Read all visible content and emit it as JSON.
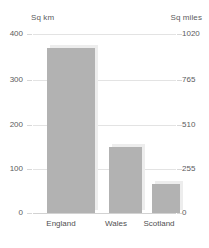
{
  "chart_data": {
    "type": "bar",
    "title": "",
    "categories": [
      "England",
      "Wales",
      "Scotland"
    ],
    "values": [
      369,
      147,
      65
    ],
    "xlabel": "",
    "ylabel": "Sq km",
    "ylabel_secondary": "Sq miles",
    "ylim": [
      0,
      400
    ],
    "ylim_secondary": [
      0,
      1020
    ],
    "yticks": [
      400,
      300,
      200,
      100,
      0
    ],
    "yticks_secondary": [
      1020,
      765,
      510,
      255,
      0
    ],
    "grid": true,
    "legend": "none",
    "bar_color": "#b2b2b2",
    "grid_color": "#e3e3e3",
    "text_color": "#5b5b5d"
  },
  "axes": {
    "left_title": "Sq km",
    "right_title": "Sq miles",
    "left_ticks": [
      {
        "label": "400",
        "value": 400
      },
      {
        "label": "300",
        "value": 300
      },
      {
        "label": "200",
        "value": 200
      },
      {
        "label": "100",
        "value": 100
      },
      {
        "label": "0",
        "value": 0
      }
    ],
    "right_ticks": [
      {
        "label": "1020",
        "value": 1020
      },
      {
        "label": "765",
        "value": 765
      },
      {
        "label": "510",
        "value": 510
      },
      {
        "label": "255",
        "value": 255
      },
      {
        "label": "0",
        "value": 0
      }
    ]
  },
  "bars": [
    {
      "category": "England",
      "value": 369
    },
    {
      "category": "Wales",
      "value": 147
    },
    {
      "category": "Scotland",
      "value": 65
    }
  ]
}
